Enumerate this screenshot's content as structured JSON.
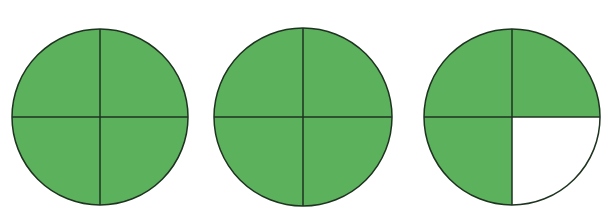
{
  "colors": {
    "fill": "#5cb15c",
    "empty": "#ffffff",
    "stroke": "#1e3320",
    "background": "#ffffff"
  },
  "diagram": {
    "parts_per_circle": 4,
    "circles": [
      {
        "id": "circle-1",
        "cx": 100,
        "cy": 117,
        "r": 88,
        "shaded": [
          true,
          true,
          true,
          true
        ],
        "label": "4/4"
      },
      {
        "id": "circle-2",
        "cx": 303,
        "cy": 117,
        "r": 89,
        "shaded": [
          true,
          true,
          true,
          true
        ],
        "label": "4/4"
      },
      {
        "id": "circle-3",
        "cx": 512,
        "cy": 117,
        "r": 88,
        "shaded": [
          true,
          true,
          true,
          false
        ],
        "label": "3/4"
      }
    ],
    "quadrant_order": [
      "top-left",
      "top-right",
      "bottom-left",
      "bottom-right"
    ],
    "total_shaded": "11/4"
  }
}
